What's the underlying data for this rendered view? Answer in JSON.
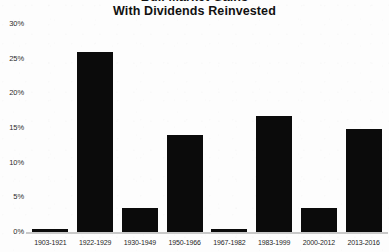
{
  "chart_data": {
    "type": "bar",
    "title": "With Dividends Reinvested",
    "title_line_1": "Bull Market Gains",
    "title_line_2": "With Dividends Reinvested",
    "xlabel": "",
    "ylabel": "",
    "ylim": [
      0,
      30
    ],
    "yticks": [
      0,
      5,
      10,
      15,
      20,
      25,
      30
    ],
    "ytick_labels": [
      "0%",
      "5%",
      "10%",
      "15%",
      "20%",
      "25%",
      "30%"
    ],
    "grid": false,
    "legend": "none",
    "bar_color": "#0b0b0b",
    "axis_color": "#c9c9c9",
    "categories": [
      "1903-1921",
      "1922-1929",
      "1930-1949",
      "1950-1966",
      "1967-1982",
      "1983-1999",
      "2000-2012",
      "2013-2016"
    ],
    "values": [
      0.5,
      26.0,
      3.5,
      14.0,
      0.5,
      16.7,
      3.5,
      14.9
    ]
  }
}
